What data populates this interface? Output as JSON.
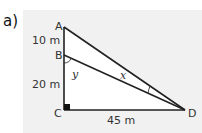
{
  "part_label": "a)",
  "diagram": {
    "points": {
      "A": "A",
      "B": "B",
      "C": "C",
      "D": "D"
    },
    "lengths": {
      "AB": "10 m",
      "BC": "20 m",
      "CD": "45 m"
    },
    "angles": {
      "x": "x",
      "y": "y"
    },
    "right_angle_at": "C"
  }
}
